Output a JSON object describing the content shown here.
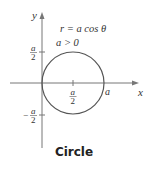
{
  "diagram": {
    "equation": "r = a cos θ",
    "condition": "a > 0",
    "x_axis_label": "x",
    "y_axis_label": "y",
    "ticks": {
      "y_pos_num": "a",
      "y_pos_den": "2",
      "y_neg_sign": "−",
      "y_neg_num": "a",
      "y_neg_den": "2",
      "x_half_num": "a",
      "x_half_den": "2",
      "x_full": "a"
    },
    "caption": "Circle",
    "colors": {
      "curve": "#555555",
      "axes": "#777777"
    }
  }
}
